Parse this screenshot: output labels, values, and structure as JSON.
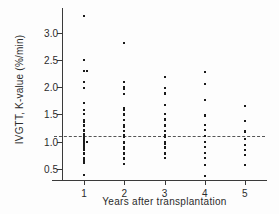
{
  "chart_data": {
    "type": "scatter",
    "title": "",
    "xlabel": "Years after transplantation",
    "ylabel": "IVGTT, K-value (%/min)",
    "xlim": [
      0.45,
      5.55
    ],
    "ylim": [
      0.3,
      3.45
    ],
    "xticks": [
      1,
      2,
      3,
      4,
      5
    ],
    "xtick_labels": [
      "1",
      "2",
      "3",
      "4",
      "5"
    ],
    "yticks": [
      0.5,
      1.0,
      1.5,
      2.0,
      2.5,
      3.0
    ],
    "ytick_labels": [
      "0.5",
      "1.0",
      "1.5",
      "2.0",
      "2.5",
      "3.0"
    ],
    "grid": false,
    "legend": null,
    "marker": "square",
    "marker_color": "#1a1a1a",
    "reference_line": {
      "orientation": "horizontal",
      "value": 1.1,
      "style": "dashed",
      "color": "#555555"
    },
    "series": [
      {
        "name": "1",
        "x": 1,
        "values": [
          3.3,
          2.49,
          2.3,
          2.3,
          2.29,
          2.1,
          1.99,
          1.71,
          1.59,
          1.58,
          1.5,
          1.4,
          1.37,
          1.3,
          1.29,
          1.28,
          1.21,
          1.2,
          1.19,
          1.15,
          1.12,
          1.1,
          1.08,
          1.07,
          1.05,
          1.02,
          1.0,
          1.0,
          0.99,
          0.99,
          0.98,
          0.97,
          0.96,
          0.95,
          0.94,
          0.9,
          0.88,
          0.87,
          0.86,
          0.85,
          0.8,
          0.79,
          0.78,
          0.7,
          0.69,
          0.64,
          0.63,
          0.62,
          0.4
        ]
      },
      {
        "name": "2",
        "x": 2,
        "values": [
          2.8,
          2.09,
          2.0,
          1.99,
          1.98,
          1.97,
          1.96,
          1.88,
          1.62,
          1.58,
          1.5,
          1.49,
          1.4,
          1.31,
          1.3,
          1.29,
          1.28,
          1.27,
          1.2,
          1.12,
          1.1,
          1.09,
          1.08,
          1.0,
          0.99,
          0.98,
          0.97,
          0.9,
          0.88,
          0.86,
          0.8,
          0.79,
          0.78,
          0.7,
          0.68,
          0.6
        ]
      },
      {
        "name": "3",
        "x": 3,
        "values": [
          2.18,
          1.98,
          1.9,
          1.88,
          1.67,
          1.5,
          1.42,
          1.4,
          1.3,
          1.29,
          1.28,
          1.2,
          1.12,
          1.1,
          1.09,
          1.08,
          1.0,
          0.98,
          0.96,
          0.9,
          0.88,
          0.8,
          0.79,
          0.78,
          0.77,
          0.7
        ]
      },
      {
        "name": "4",
        "x": 4,
        "values": [
          2.28,
          2.27,
          2.06,
          1.77,
          1.49,
          1.48,
          1.3,
          1.22,
          1.1,
          1.0,
          0.99,
          0.9,
          0.8,
          0.7,
          0.58,
          0.38
        ]
      },
      {
        "name": "5",
        "x": 5,
        "values": [
          1.66,
          1.38,
          1.19,
          1.17,
          1.05,
          0.95,
          0.85,
          0.75,
          0.58
        ]
      }
    ]
  }
}
